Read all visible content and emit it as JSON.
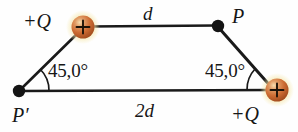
{
  "figure": {
    "type": "physics-diagram",
    "background_color": "#fefefe",
    "line_color": "#1a1a1a",
    "charge_sphere_color": "#c8622e",
    "charge_sphere_highlight": "#f0c98a",
    "charge_glow_color": "#f2e2a0",
    "point_dot_color": "#141414"
  },
  "labels": {
    "charge_left": "+Q",
    "charge_right": "+Q",
    "point_p": "P",
    "point_p_prime": "P′",
    "distance_top": "d",
    "distance_bottom": "2d",
    "angle_left": "45,0°",
    "angle_right": "45,0°",
    "charge_sign_glyph": "+"
  },
  "geometry": {
    "vertices": [
      {
        "name": "charge-left",
        "kind": "charge",
        "x": 83,
        "y": 27
      },
      {
        "name": "point-p",
        "kind": "point",
        "x": 218,
        "y": 26
      },
      {
        "name": "charge-right",
        "kind": "charge",
        "x": 277,
        "y": 90
      },
      {
        "name": "point-p-prime",
        "kind": "point",
        "x": 19,
        "y": 91
      }
    ],
    "edges": [
      {
        "name": "top-side",
        "from": "charge-left",
        "to": "point-p",
        "label": "d"
      },
      {
        "name": "right-side",
        "from": "point-p",
        "to": "charge-right",
        "label": ""
      },
      {
        "name": "bottom-side",
        "from": "point-p-prime",
        "to": "charge-right",
        "label": "2d"
      },
      {
        "name": "left-side",
        "from": "point-p-prime",
        "to": "charge-left",
        "label": ""
      }
    ],
    "angles": [
      {
        "name": "angle-at-p-prime",
        "vertex": "point-p-prime",
        "value": "45,0°"
      },
      {
        "name": "angle-at-charge-right",
        "vertex": "charge-right",
        "value": "45,0°"
      }
    ]
  }
}
